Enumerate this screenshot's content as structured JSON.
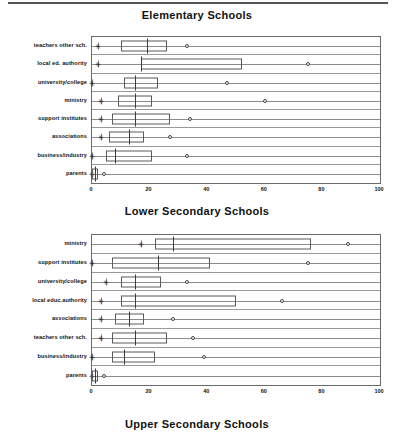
{
  "page": {
    "titles": {
      "elementary": "Elementary Schools",
      "lower": "Lower Secondary Schools",
      "upper": "Upper Secondary Schools"
    }
  },
  "chart_data": [
    {
      "type": "boxplot",
      "title": "Elementary Schools",
      "xlabel": "",
      "ylabel": "",
      "xlim": [
        0,
        100
      ],
      "xticks": [
        0,
        20,
        40,
        60,
        80,
        100
      ],
      "grid": false,
      "orientation": "horizontal",
      "categories": [
        "teachers other sch.",
        "local ed. authority",
        "university/college",
        "ministry",
        "support institutes",
        "associations",
        "business/industry",
        "parents"
      ],
      "boxes": [
        {
          "category": "teachers other sch.",
          "whisker_low": 2,
          "q1": 10,
          "median": 19,
          "q3": 26,
          "whisker_high": 33,
          "outliers": [
            33
          ]
        },
        {
          "category": "local ed. authority",
          "whisker_low": 2,
          "q1": 17,
          "median": 17,
          "q3": 52,
          "whisker_high": 75,
          "outliers": [
            75
          ]
        },
        {
          "category": "university/college",
          "whisker_low": 0,
          "q1": 11,
          "median": 15,
          "q3": 23,
          "whisker_high": 47,
          "outliers": [
            47
          ]
        },
        {
          "category": "ministry",
          "whisker_low": 3,
          "q1": 9,
          "median": 15,
          "q3": 21,
          "whisker_high": 60,
          "outliers": [
            60
          ]
        },
        {
          "category": "support institutes",
          "whisker_low": 3,
          "q1": 7,
          "median": 15,
          "q3": 27,
          "whisker_high": 34,
          "outliers": [
            34
          ]
        },
        {
          "category": "associations",
          "whisker_low": 3,
          "q1": 6,
          "median": 13,
          "q3": 18,
          "whisker_high": 27,
          "outliers": [
            27
          ]
        },
        {
          "category": "business/industry",
          "whisker_low": 0,
          "q1": 5,
          "median": 8,
          "q3": 21,
          "whisker_high": 33,
          "outliers": [
            33
          ]
        },
        {
          "category": "parents",
          "whisker_low": 0,
          "q1": 0,
          "median": 1,
          "q3": 2,
          "whisker_high": 4,
          "outliers": [
            4
          ]
        }
      ]
    },
    {
      "type": "boxplot",
      "title": "Lower Secondary Schools",
      "xlabel": "",
      "ylabel": "",
      "xlim": [
        0,
        100
      ],
      "xticks": [
        0,
        20,
        40,
        60,
        80,
        100
      ],
      "grid": false,
      "orientation": "horizontal",
      "categories": [
        "ministry",
        "support institutes",
        "university/college",
        "local educ.authority",
        "associations",
        "teachers other sch.",
        "business/industry",
        "parents"
      ],
      "boxes": [
        {
          "category": "ministry",
          "whisker_low": 17,
          "q1": 22,
          "median": 28,
          "q3": 76,
          "whisker_high": 89,
          "outliers": [
            89
          ]
        },
        {
          "category": "support institutes",
          "whisker_low": 0,
          "q1": 7,
          "median": 23,
          "q3": 41,
          "whisker_high": 75,
          "outliers": [
            75
          ]
        },
        {
          "category": "university/college",
          "whisker_low": 5,
          "q1": 10,
          "median": 15,
          "q3": 24,
          "whisker_high": 33,
          "outliers": [
            33
          ]
        },
        {
          "category": "local educ.authority",
          "whisker_low": 3,
          "q1": 10,
          "median": 15,
          "q3": 50,
          "whisker_high": 66,
          "outliers": [
            66
          ]
        },
        {
          "category": "associations",
          "whisker_low": 3,
          "q1": 8,
          "median": 13,
          "q3": 18,
          "whisker_high": 28,
          "outliers": [
            28
          ]
        },
        {
          "category": "teachers other sch.",
          "whisker_low": 3,
          "q1": 7,
          "median": 15,
          "q3": 26,
          "whisker_high": 35,
          "outliers": [
            35
          ]
        },
        {
          "category": "business/industry",
          "whisker_low": 0,
          "q1": 7,
          "median": 11,
          "q3": 22,
          "whisker_high": 39,
          "outliers": [
            39
          ]
        },
        {
          "category": "parents",
          "whisker_low": 0,
          "q1": 0,
          "median": 1,
          "q3": 2,
          "whisker_high": 4,
          "outliers": [
            4
          ]
        }
      ]
    }
  ]
}
